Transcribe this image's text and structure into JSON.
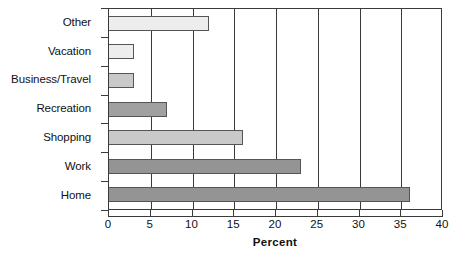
{
  "chart_data": {
    "type": "bar",
    "orientation": "horizontal",
    "title": "",
    "xlabel": "Percent",
    "ylabel": "",
    "xlim": [
      0,
      40
    ],
    "xticks": [
      0,
      5,
      10,
      15,
      20,
      25,
      30,
      35,
      40
    ],
    "grid": true,
    "legend": false,
    "categories": [
      "Other",
      "Vacation",
      "Business/Travel",
      "Recreation",
      "Shopping",
      "Work",
      "Home"
    ],
    "values": [
      12,
      3,
      3,
      7,
      16,
      23,
      36
    ],
    "bar_colors": [
      "#ededed",
      "#ededed",
      "#c9c9c9",
      "#a0a0a0",
      "#c9c9c9",
      "#949494",
      "#949494"
    ],
    "bar_edge_color": "#555555"
  },
  "axis": {
    "x_title": "Percent",
    "tick_labels": [
      "0",
      "5",
      "10",
      "15",
      "20",
      "25",
      "30",
      "35",
      "40"
    ]
  }
}
